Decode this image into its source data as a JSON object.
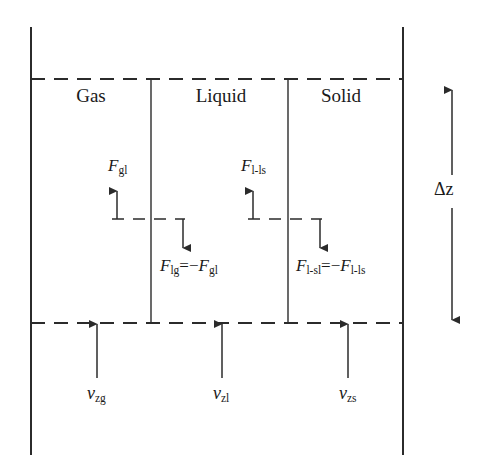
{
  "figure": {
    "type": "diagram",
    "background_color": "#ffffff",
    "line_color": "#2b2b2b"
  },
  "phases": [
    {
      "key": "gas",
      "label": "Gas"
    },
    {
      "key": "liquid",
      "label": "Liquid"
    },
    {
      "key": "solid",
      "label": "Solid"
    }
  ],
  "forces": {
    "gas_liquid_up": {
      "symbol": "F",
      "sub": "gl",
      "direction": "up"
    },
    "liquid_gas_down": {
      "symbol": "F",
      "sub": "lg",
      "equals": "=−",
      "rhs_symbol": "F",
      "rhs_sub": "gl",
      "direction": "down"
    },
    "liquid_solid_up": {
      "symbol": "F",
      "sub": "l-ls",
      "direction": "up"
    },
    "liquid_solid_down": {
      "symbol": "F",
      "sub": "l-sl",
      "equals": "=−",
      "rhs_symbol": "F",
      "rhs_sub": "l-ls",
      "direction": "down"
    }
  },
  "velocities": [
    {
      "key": "gas",
      "symbol": "ν",
      "sub": "zg"
    },
    {
      "key": "liquid",
      "symbol": "ν",
      "sub": "zl"
    },
    {
      "key": "solid",
      "symbol": "ν",
      "sub": "zs"
    }
  ],
  "dimension": {
    "label": "Δz",
    "arrow": "double-headed-vertical"
  }
}
